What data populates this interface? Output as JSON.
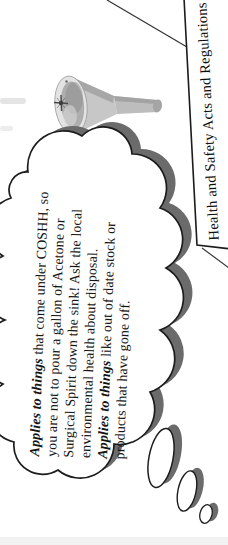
{
  "page": {
    "type": "scanned mind-map page",
    "background": "#ffffff"
  },
  "node_box": {
    "label": "Health and Safety Acts and Regulations"
  },
  "thought_bubble": {
    "lines": [
      {
        "lead": "Applies to things",
        "rest": " that come under COSHH, so"
      },
      {
        "lead": "",
        "rest": "you are not to pour a gallon of Acetone or"
      },
      {
        "lead": "",
        "rest": "Surgical Spirit down the sink! Ask the local"
      },
      {
        "lead": "",
        "rest": "environmental health about disposal."
      },
      {
        "lead": "Applies to things",
        "rest": " like out of date stock or"
      },
      {
        "lead": "",
        "rest": "products that have gone off."
      }
    ]
  },
  "icons": {
    "funnel": "funnel-clipart"
  },
  "colors": {
    "shadow_gray": "#6b6b6b",
    "outline_black": "#1c1c1c",
    "branch_line": "#333333",
    "funnel_body": "#c7c7c7",
    "funnel_rim": "#e3e3e3",
    "funnel_inner": "#aeaeae"
  }
}
